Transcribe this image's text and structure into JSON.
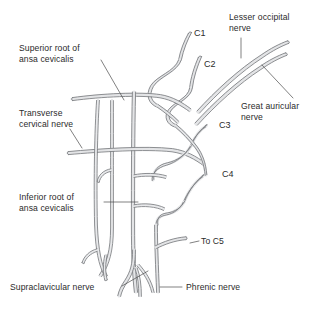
{
  "figure": {
    "type": "anatomical-diagram",
    "background_color": "#ffffff",
    "nerve_outline_color": "#7a7c80",
    "nerve_fill_color": "#e3e4e6",
    "text_color": "#2b2b2b",
    "leader_color": "#4a4a4a"
  },
  "labels": {
    "superior_root": "Superior root of\nansa cevicalis",
    "transverse_cervical": "Transverse\ncervical nerve",
    "inferior_root": "Inferior root of\nansa cevicalis",
    "supraclavicular": "Supraclavicular nerve",
    "lesser_occipital": "Lesser occipital\nnerve",
    "great_auricular": "Great auricular\nnerve",
    "to_c5": "To C5",
    "phrenic": "Phrenic nerve"
  },
  "roots": {
    "c1": "C1",
    "c2": "C2",
    "c3": "C3",
    "c4": "C4"
  }
}
